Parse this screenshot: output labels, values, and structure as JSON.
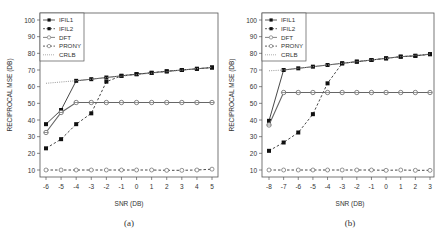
{
  "chart_data": [
    {
      "type": "line",
      "panel_label": "(a)",
      "xlabel": "SNR (DB)",
      "ylabel": "RECIPROCAL MSE (DB)",
      "x": [
        -6,
        -5,
        -4,
        -3,
        -2,
        -1,
        0,
        1,
        2,
        3,
        4,
        5
      ],
      "xlim": [
        -6,
        5
      ],
      "ylim": [
        10,
        100
      ],
      "yticks": [
        10,
        20,
        30,
        40,
        50,
        60,
        70,
        80,
        90,
        100
      ],
      "grid": false,
      "legend_position": "top-left",
      "series": [
        {
          "name": "IFIL1",
          "style": "solid-filled-square",
          "values": [
            37.5,
            46,
            63.5,
            64.5,
            65.5,
            66.5,
            67.5,
            68.3,
            69.2,
            70,
            70.7,
            71.5
          ]
        },
        {
          "name": "IFIL2",
          "style": "dashed-filled-square",
          "values": [
            23,
            28.5,
            37.5,
            44,
            63,
            66.5,
            67.5,
            68.3,
            69.2,
            70,
            70.7,
            71.5
          ]
        },
        {
          "name": "DFT",
          "style": "solid-open-circle-line",
          "values": [
            32.5,
            44.5,
            50.5,
            50.5,
            50.5,
            50.5,
            50.5,
            50.5,
            50.5,
            50.5,
            50.5,
            50.5
          ]
        },
        {
          "name": "PRONY",
          "style": "dashed-open-circle",
          "values": [
            10,
            10,
            10,
            10,
            10,
            10,
            10,
            10,
            9.8,
            9.8,
            10,
            10.5
          ]
        },
        {
          "name": "CRLB",
          "style": "dotted",
          "values": [
            62,
            62.8,
            63.6,
            64.5,
            65.4,
            66.3,
            67.2,
            68.1,
            69,
            69.9,
            70.8,
            71.7
          ]
        }
      ]
    },
    {
      "type": "line",
      "panel_label": "(b)",
      "xlabel": "SNR (DB)",
      "ylabel": "RECIPROCAL MSE (DB)",
      "x": [
        -8,
        -7,
        -6,
        -5,
        -4,
        -3,
        -2,
        -1,
        0,
        1,
        2,
        3
      ],
      "xlim": [
        -8,
        3
      ],
      "ylim": [
        10,
        100
      ],
      "yticks": [
        10,
        20,
        30,
        40,
        50,
        60,
        70,
        80,
        90,
        100
      ],
      "grid": false,
      "legend_position": "top-left",
      "series": [
        {
          "name": "IFIL1",
          "style": "solid-filled-square",
          "values": [
            39.5,
            70,
            71,
            72,
            73,
            74,
            75,
            76,
            77,
            78,
            78.5,
            79.5
          ]
        },
        {
          "name": "IFIL2",
          "style": "dashed-filled-square",
          "values": [
            21.5,
            26.5,
            32.5,
            43.5,
            62,
            74,
            75,
            76,
            77,
            78,
            78.5,
            79.5
          ]
        },
        {
          "name": "DFT",
          "style": "solid-open-circle-line",
          "values": [
            37,
            56.5,
            56.5,
            56.5,
            56.5,
            56.5,
            56.5,
            56.5,
            56.5,
            56.5,
            56.5,
            56.5
          ]
        },
        {
          "name": "PRONY",
          "style": "dashed-open-circle",
          "values": [
            10,
            10,
            10,
            10,
            10,
            10,
            10,
            10,
            9.8,
            10,
            9.8,
            9.8
          ]
        },
        {
          "name": "CRLB",
          "style": "dotted",
          "values": [
            69.5,
            70,
            71,
            72,
            73,
            74,
            75,
            76,
            77,
            78,
            78.8,
            79.6
          ]
        }
      ]
    }
  ],
  "legend": [
    "IFIL1",
    "IFIL2",
    "DFT",
    "PRONY",
    "CRLB"
  ],
  "panels": [
    {
      "label": "(a)",
      "xlabel": "SNR (DB)",
      "ylabel": "RECIPROCAL MSE (DB)",
      "xticks": [
        "-6",
        "-5",
        "-4",
        "-3",
        "-2",
        "-1",
        "0",
        "1",
        "2",
        "3",
        "4",
        "5"
      ],
      "yticks": [
        "10",
        "20",
        "30",
        "40",
        "50",
        "60",
        "70",
        "80",
        "90",
        "100"
      ]
    },
    {
      "label": "(b)",
      "xlabel": "SNR (DB)",
      "ylabel": "RECIPROCAL MSE (DB)",
      "xticks": [
        "-8",
        "-7",
        "-6",
        "-5",
        "-4",
        "-3",
        "-2",
        "-1",
        "0",
        "1",
        "2",
        "3"
      ],
      "yticks": [
        "10",
        "20",
        "30",
        "40",
        "50",
        "60",
        "70",
        "80",
        "90",
        "100"
      ]
    }
  ],
  "colors": {
    "line": "#333333",
    "dft": "#666666",
    "crlb": "#999999",
    "axis": "#555555"
  }
}
